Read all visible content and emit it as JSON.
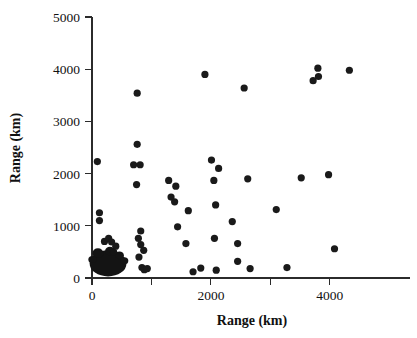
{
  "chart_data": {
    "type": "scatter",
    "title": "",
    "subtitle": "",
    "xlabel": "Range (km)",
    "ylabel": "Range (km)",
    "xlim": [
      0,
      5350
    ],
    "ylim": [
      0,
      5000
    ],
    "grid": false,
    "legend": "none",
    "x_ticks": [
      {
        "value": 0,
        "label": "0",
        "major": true
      },
      {
        "value": 1000,
        "label": "",
        "major": false
      },
      {
        "value": 2000,
        "label": "2000",
        "major": true
      },
      {
        "value": 3000,
        "label": "",
        "major": false
      },
      {
        "value": 4000,
        "label": "4000",
        "major": true
      }
    ],
    "y_ticks": [
      {
        "value": 0,
        "label": "0",
        "major": true
      },
      {
        "value": 1000,
        "label": "1000",
        "major": true
      },
      {
        "value": 2000,
        "label": "2000",
        "major": true
      },
      {
        "value": 3000,
        "label": "3000",
        "major": true
      },
      {
        "value": 4000,
        "label": "4000",
        "major": true
      },
      {
        "value": 5000,
        "label": "5000",
        "major": true
      }
    ],
    "marker": {
      "shape": "circle",
      "color": "#1a1a1a",
      "size_px": 4.6
    },
    "dense_cluster": {
      "description": "saturated overplotted blob of points near origin",
      "center_x": 270,
      "center_y": 280,
      "width_x": 620,
      "height_y": 500,
      "color": "#141414"
    },
    "points": [
      {
        "x": 90,
        "y": 2230
      },
      {
        "x": 125,
        "y": 1250
      },
      {
        "x": 125,
        "y": 1100
      },
      {
        "x": 210,
        "y": 700
      },
      {
        "x": 280,
        "y": 760
      },
      {
        "x": 330,
        "y": 690
      },
      {
        "x": 400,
        "y": 610
      },
      {
        "x": 760,
        "y": 3540
      },
      {
        "x": 760,
        "y": 2560
      },
      {
        "x": 700,
        "y": 2170
      },
      {
        "x": 810,
        "y": 2170
      },
      {
        "x": 750,
        "y": 1790
      },
      {
        "x": 820,
        "y": 900
      },
      {
        "x": 780,
        "y": 760
      },
      {
        "x": 820,
        "y": 640
      },
      {
        "x": 870,
        "y": 530
      },
      {
        "x": 790,
        "y": 400
      },
      {
        "x": 840,
        "y": 200
      },
      {
        "x": 880,
        "y": 160
      },
      {
        "x": 930,
        "y": 180
      },
      {
        "x": 1290,
        "y": 1870
      },
      {
        "x": 1410,
        "y": 1760
      },
      {
        "x": 1330,
        "y": 1550
      },
      {
        "x": 1390,
        "y": 1460
      },
      {
        "x": 1440,
        "y": 980
      },
      {
        "x": 1620,
        "y": 1290
      },
      {
        "x": 1580,
        "y": 660
      },
      {
        "x": 1700,
        "y": 120
      },
      {
        "x": 1830,
        "y": 190
      },
      {
        "x": 1900,
        "y": 3900
      },
      {
        "x": 2010,
        "y": 2260
      },
      {
        "x": 2130,
        "y": 2100
      },
      {
        "x": 2050,
        "y": 1870
      },
      {
        "x": 2080,
        "y": 1400
      },
      {
        "x": 2060,
        "y": 760
      },
      {
        "x": 2090,
        "y": 150
      },
      {
        "x": 2360,
        "y": 1080
      },
      {
        "x": 2450,
        "y": 660
      },
      {
        "x": 2450,
        "y": 320
      },
      {
        "x": 2560,
        "y": 3640
      },
      {
        "x": 2620,
        "y": 1900
      },
      {
        "x": 2660,
        "y": 180
      },
      {
        "x": 3100,
        "y": 1310
      },
      {
        "x": 3280,
        "y": 200
      },
      {
        "x": 3520,
        "y": 1920
      },
      {
        "x": 3720,
        "y": 3780
      },
      {
        "x": 3800,
        "y": 4020
      },
      {
        "x": 3810,
        "y": 3860
      },
      {
        "x": 3980,
        "y": 1980
      },
      {
        "x": 4080,
        "y": 560
      },
      {
        "x": 4330,
        "y": 3980
      }
    ]
  }
}
